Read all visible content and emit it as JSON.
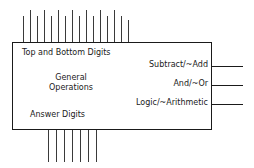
{
  "diagram": {
    "block": {
      "name": "alu-block",
      "inner_labels": {
        "top_bottom_digits": "Top and Bottom Digits",
        "general_operations_line1": "General",
        "general_operations_line2": "Operations",
        "answer_digits": "Answer Digits"
      }
    },
    "control_signals": [
      {
        "label": "Subtract/~Add"
      },
      {
        "label": "And/~Or"
      },
      {
        "label": "Logic/~Arithmetic"
      }
    ],
    "buses": {
      "top_inputs": {
        "name": "Top and Bottom Digits input bus",
        "count": 16,
        "lines": [
          {
            "x": 23,
            "top": 16
          },
          {
            "x": 30,
            "top": 10
          },
          {
            "x": 37,
            "top": 16
          },
          {
            "x": 44,
            "top": 10
          },
          {
            "x": 51,
            "top": 16
          },
          {
            "x": 58,
            "top": 10
          },
          {
            "x": 65,
            "top": 16
          },
          {
            "x": 72,
            "top": 10
          },
          {
            "x": 79,
            "top": 16
          },
          {
            "x": 86,
            "top": 10
          },
          {
            "x": 93,
            "top": 16
          },
          {
            "x": 100,
            "top": 10
          },
          {
            "x": 107,
            "top": 16
          },
          {
            "x": 114,
            "top": 10
          },
          {
            "x": 121,
            "top": 16
          },
          {
            "x": 128,
            "top": 20
          }
        ]
      },
      "bottom_outputs": {
        "name": "Answer Digits output bus",
        "count": 7,
        "lines": [
          {
            "x": 48,
            "height": 32
          },
          {
            "x": 56,
            "height": 32
          },
          {
            "x": 64,
            "height": 32
          },
          {
            "x": 72,
            "height": 32
          },
          {
            "x": 80,
            "height": 32
          },
          {
            "x": 88,
            "height": 32
          },
          {
            "x": 96,
            "height": 32
          }
        ]
      }
    },
    "colors": {
      "stroke": "#1a1a1a",
      "bus_stroke": "#3a3a3a",
      "background": "#ffffff"
    }
  }
}
